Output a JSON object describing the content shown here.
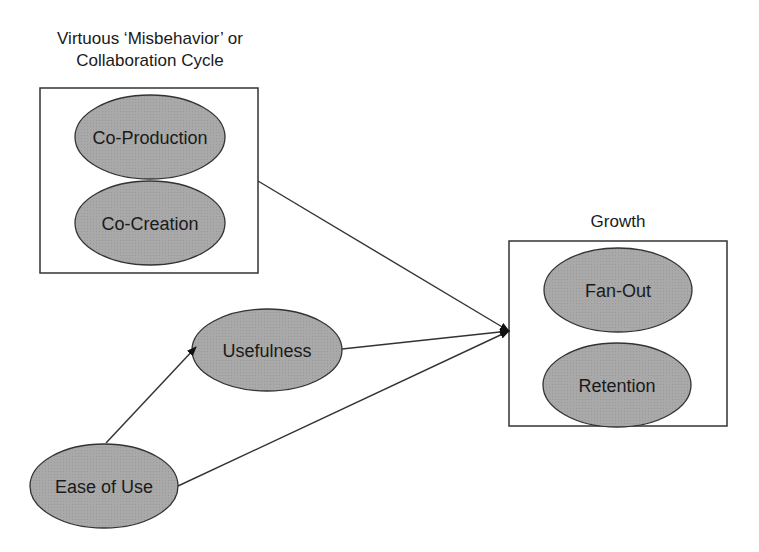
{
  "groups": {
    "collaboration": {
      "title_line1": "Virtuous ‘Misbehavior’ or",
      "title_line2": "Collaboration Cycle",
      "nodes": [
        "Co-Production",
        "Co-Creation"
      ]
    },
    "growth": {
      "title": "Growth",
      "nodes": [
        "Fan-Out",
        "Retention"
      ]
    }
  },
  "nodes": {
    "usefulness": "Usefulness",
    "ease_of_use": "Ease of Use"
  },
  "edges": [
    {
      "from": "Ease of Use",
      "to": "Usefulness"
    },
    {
      "from": "Virtuous ‘Misbehavior’ or Collaboration Cycle",
      "to": "Growth"
    },
    {
      "from": "Usefulness",
      "to": "Growth"
    },
    {
      "from": "Ease of Use",
      "to": "Growth"
    }
  ],
  "colors": {
    "node_fill": "#a8a8a8",
    "stroke": "#333333",
    "background": "#ffffff"
  }
}
